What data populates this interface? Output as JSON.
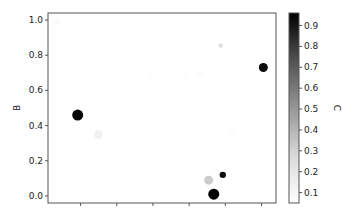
{
  "chart_data": {
    "type": "scatter",
    "title": "",
    "xlabel": "",
    "ylabel": "B",
    "colorbar_label": "C",
    "colormap": "Greys",
    "xlim": [
      0.1,
      6.4
    ],
    "ylim": [
      -0.04,
      1.04
    ],
    "x_ticks": [
      1,
      2,
      3,
      4,
      5,
      6
    ],
    "x_tick_labels": [
      "",
      "",
      "",
      "",
      "",
      ""
    ],
    "y_ticks": [
      0.0,
      0.2,
      0.4,
      0.6,
      0.8,
      1.0
    ],
    "y_tick_labels": [
      "0.0",
      "0.2",
      "0.4",
      "0.6",
      "0.8",
      "1.0"
    ],
    "colorbar_ticks": [
      0.1,
      0.2,
      0.3,
      0.4,
      0.5,
      0.6,
      0.7,
      0.8,
      0.9
    ],
    "colorbar_tick_labels": [
      "0.1",
      "0.2",
      "0.3",
      "0.4",
      "0.5",
      "0.6",
      "0.7",
      "0.8",
      "0.9"
    ],
    "colorbar_range": [
      0.05,
      0.96
    ],
    "grid": false,
    "points": [
      {
        "x": 0.92,
        "y": 0.46,
        "c": 0.95,
        "size": 5.5
      },
      {
        "x": 1.49,
        "y": 0.35,
        "c": 0.13,
        "size": 4.5
      },
      {
        "x": 6.05,
        "y": 0.73,
        "c": 0.93,
        "size": 4.5
      },
      {
        "x": 4.87,
        "y": 0.855,
        "c": 0.25,
        "size": 2.2
      },
      {
        "x": 4.54,
        "y": 0.09,
        "c": 0.32,
        "size": 4.5
      },
      {
        "x": 4.93,
        "y": 0.12,
        "c": 0.92,
        "size": 3.2
      },
      {
        "x": 4.68,
        "y": 0.01,
        "c": 0.96,
        "size": 5.5
      },
      {
        "x": 0.35,
        "y": 0.995,
        "c": 0.08,
        "size": 3.5
      },
      {
        "x": 4.3,
        "y": 0.7,
        "c": 0.07,
        "size": 3.5
      },
      {
        "x": 3.87,
        "y": 0.68,
        "c": 0.06,
        "size": 3
      },
      {
        "x": 5.2,
        "y": 0.37,
        "c": 0.07,
        "size": 3.5
      },
      {
        "x": 2.9,
        "y": 0.68,
        "c": 0.06,
        "size": 3
      }
    ]
  },
  "layout": {
    "plot": {
      "left": 48,
      "top": 13,
      "right": 276,
      "bottom": 203
    },
    "colorbar": {
      "left": 289,
      "top": 13,
      "width": 10,
      "height": 190
    }
  }
}
